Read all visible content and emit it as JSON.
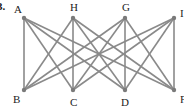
{
  "problem_number": "3.",
  "graph": {
    "type": "bipartite",
    "edge_color": "#8a8a8a",
    "node_color": "#7a7a7a",
    "nodes": [
      {
        "id": "A",
        "label": "A",
        "x": 24,
        "y": 18,
        "label_x": 14,
        "label_y": 13
      },
      {
        "id": "H",
        "label": "H",
        "x": 73,
        "y": 18,
        "label_x": 70,
        "label_y": 11
      },
      {
        "id": "G",
        "label": "G",
        "x": 125,
        "y": 18,
        "label_x": 122,
        "label_y": 11
      },
      {
        "id": "I",
        "label": "I",
        "x": 174,
        "y": 18,
        "label_x": 180,
        "label_y": 17
      },
      {
        "id": "B",
        "label": "B",
        "x": 24,
        "y": 90,
        "label_x": 13,
        "label_y": 103
      },
      {
        "id": "C",
        "label": "C",
        "x": 73,
        "y": 90,
        "label_x": 70,
        "label_y": 106
      },
      {
        "id": "D",
        "label": "D",
        "x": 125,
        "y": 90,
        "label_x": 121,
        "label_y": 106
      },
      {
        "id": "F",
        "label": "F",
        "x": 174,
        "y": 90,
        "label_x": 180,
        "label_y": 103
      }
    ],
    "edges": [
      [
        "A",
        "B"
      ],
      [
        "A",
        "C"
      ],
      [
        "A",
        "D"
      ],
      [
        "A",
        "F"
      ],
      [
        "H",
        "B"
      ],
      [
        "H",
        "C"
      ],
      [
        "H",
        "D"
      ],
      [
        "H",
        "F"
      ],
      [
        "G",
        "B"
      ],
      [
        "G",
        "C"
      ],
      [
        "G",
        "D"
      ],
      [
        "G",
        "F"
      ],
      [
        "I",
        "B"
      ],
      [
        "I",
        "C"
      ],
      [
        "I",
        "D"
      ],
      [
        "I",
        "F"
      ]
    ]
  }
}
